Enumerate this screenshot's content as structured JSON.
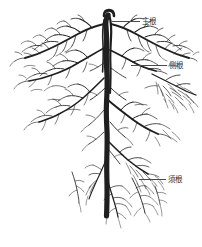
{
  "figure": {
    "name": "plant-root-system-diagram",
    "background_color": "#ffffff",
    "ink_color": "#1f1f1f",
    "leader_color": "#4a4a4a",
    "width": 202,
    "height": 247
  },
  "callouts": [
    {
      "id": "taproot",
      "label": "主根",
      "leader_from_x": 112,
      "leader_to_x": 140,
      "y": 22
    },
    {
      "id": "lateral",
      "label": "侧根",
      "leader_from_x": 131,
      "leader_to_x": 167,
      "y": 66
    },
    {
      "id": "fibrous",
      "label": "须根",
      "leader_from_x": 139,
      "leader_to_x": 166,
      "y": 180
    }
  ],
  "diagram_data": {
    "type": "botanical-illustration",
    "subject": "root system",
    "taproot_axis_x": 108,
    "taproot_top_y": 15,
    "taproot_bottom_y": 215,
    "canopy_left_x": 10,
    "canopy_right_x": 196,
    "labels_count": 3
  }
}
